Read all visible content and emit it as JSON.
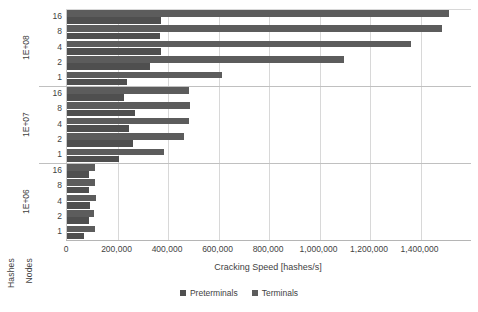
{
  "chart_data": {
    "type": "bar",
    "orientation": "horizontal",
    "title": "",
    "xlabel": "Cracking Speed [hashes/s]",
    "ylabel": "Nodes",
    "y_outer_label": "Hashes",
    "xlim": [
      0,
      1600000
    ],
    "xticks": [
      0,
      200000,
      400000,
      600000,
      800000,
      1000000,
      1200000,
      1400000
    ],
    "xtick_labels": [
      "0",
      "200,000",
      "400,000",
      "600,000",
      "800,000",
      "1,000,000",
      "1,200,000",
      "1,400,000"
    ],
    "grid": true,
    "legend_position": "bottom",
    "legend": [
      "Preterminals",
      "Terminals"
    ],
    "groups": [
      {
        "label": "1E+08",
        "categories": [
          "16",
          "8",
          "4",
          "2",
          "1"
        ],
        "series": [
          {
            "name": "Terminals",
            "values": [
              1514000,
              1485000,
              1363000,
              1098000,
              612000
            ]
          },
          {
            "name": "Preterminals",
            "values": [
              372000,
              368000,
              372000,
              328000,
              236000
            ]
          }
        ]
      },
      {
        "label": "1E+07",
        "categories": [
          "16",
          "8",
          "4",
          "2",
          "1"
        ],
        "series": [
          {
            "name": "Terminals",
            "values": [
              483000,
              487000,
              483000,
              462000,
              384000
            ]
          },
          {
            "name": "Preterminals",
            "values": [
              224000,
              268000,
              244000,
              260000,
              204000
            ]
          }
        ]
      },
      {
        "label": "1E+06",
        "categories": [
          "16",
          "8",
          "4",
          "2",
          "1"
        ],
        "series": [
          {
            "name": "Terminals",
            "values": [
              112000,
              110000,
              113000,
              108000,
              110000
            ]
          },
          {
            "name": "Preterminals",
            "values": [
              88000,
              87000,
              90000,
              86000,
              68000
            ]
          }
        ]
      }
    ],
    "colors": {
      "preterminals": "#4f4f4f",
      "terminals": "#5c5c5c",
      "grid": "#d8d8d8",
      "axis": "#b5b5b5",
      "text": "#3f3f3f",
      "background": "#ffffff"
    }
  }
}
